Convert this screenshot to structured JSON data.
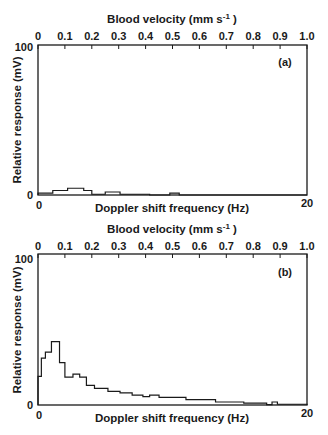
{
  "chart_data": [
    {
      "type": "bar",
      "style": "step-histogram",
      "panel_label": "(a)",
      "top_axis": {
        "title": "Blood velocity (mm s",
        "title_sup": "-1",
        "title_end": " )",
        "ticks": [
          "0",
          "0.1",
          "0.2",
          "0.3",
          "0.4",
          "0.5",
          "0.6",
          "0.7",
          "0.8",
          "0.9",
          "1.0"
        ],
        "range": [
          0,
          1.0
        ]
      },
      "xlabel": "Doppler shift frequency (Hz)",
      "ylabel": "Relative response (mV)",
      "x_ticks": [
        "0",
        "20"
      ],
      "y_ticks": [
        "0",
        "100"
      ],
      "xlim": [
        0,
        20
      ],
      "ylim": [
        0,
        100
      ],
      "bins": [
        {
          "x0": 0.0,
          "x1": 1.1,
          "y": 1.3
        },
        {
          "x0": 1.1,
          "x1": 2.2,
          "y": 3.0
        },
        {
          "x0": 2.2,
          "x1": 3.4,
          "y": 4.5
        },
        {
          "x0": 3.4,
          "x1": 4.0,
          "y": 3.0
        },
        {
          "x0": 4.0,
          "x1": 5.0,
          "y": 0.5
        },
        {
          "x0": 5.0,
          "x1": 6.1,
          "y": 2.0
        },
        {
          "x0": 6.1,
          "x1": 8.3,
          "y": 0.5
        },
        {
          "x0": 8.3,
          "x1": 9.8,
          "y": 0.0
        },
        {
          "x0": 9.8,
          "x1": 10.5,
          "y": 1.3
        },
        {
          "x0": 10.5,
          "x1": 20.0,
          "y": 0.0
        }
      ]
    },
    {
      "type": "bar",
      "style": "step-histogram",
      "panel_label": "(b)",
      "top_axis": {
        "title": "Blood velocity (mm s",
        "title_sup": "-1",
        "title_end": " )",
        "ticks": [
          "0",
          "0.1",
          "0.2",
          "0.3",
          "0.4",
          "0.5",
          "0.6",
          "0.7",
          "0.8",
          "0.9",
          "1.0"
        ],
        "range": [
          0,
          1.0
        ]
      },
      "xlabel": "Doppler shift frequency (Hz)",
      "ylabel": "Relative response (mV)",
      "x_ticks": [
        "0",
        "20"
      ],
      "y_ticks": [
        "0",
        "100"
      ],
      "xlim": [
        0,
        20
      ],
      "ylim": [
        0,
        100
      ],
      "bins": [
        {
          "x0": 0.0,
          "x1": 0.25,
          "y": 19
        },
        {
          "x0": 0.25,
          "x1": 0.55,
          "y": 31
        },
        {
          "x0": 0.55,
          "x1": 1.0,
          "y": 35
        },
        {
          "x0": 1.0,
          "x1": 1.6,
          "y": 42
        },
        {
          "x0": 1.6,
          "x1": 2.0,
          "y": 28
        },
        {
          "x0": 2.0,
          "x1": 2.6,
          "y": 18.5
        },
        {
          "x0": 2.6,
          "x1": 3.1,
          "y": 20.5
        },
        {
          "x0": 3.1,
          "x1": 3.6,
          "y": 18.5
        },
        {
          "x0": 3.6,
          "x1": 4.2,
          "y": 13
        },
        {
          "x0": 4.2,
          "x1": 5.2,
          "y": 11
        },
        {
          "x0": 5.2,
          "x1": 6.1,
          "y": 9
        },
        {
          "x0": 6.1,
          "x1": 7.0,
          "y": 8
        },
        {
          "x0": 7.0,
          "x1": 7.8,
          "y": 6.5
        },
        {
          "x0": 7.8,
          "x1": 8.3,
          "y": 5.5
        },
        {
          "x0": 8.3,
          "x1": 9.0,
          "y": 6.5
        },
        {
          "x0": 9.0,
          "x1": 11.0,
          "y": 5
        },
        {
          "x0": 11.0,
          "x1": 13.2,
          "y": 3.5
        },
        {
          "x0": 13.2,
          "x1": 15.3,
          "y": 2
        },
        {
          "x0": 15.3,
          "x1": 17.0,
          "y": 1.2
        },
        {
          "x0": 17.0,
          "x1": 17.4,
          "y": 0.3
        },
        {
          "x0": 17.4,
          "x1": 17.8,
          "y": 2
        },
        {
          "x0": 17.8,
          "x1": 20.0,
          "y": 0.5
        }
      ]
    }
  ]
}
